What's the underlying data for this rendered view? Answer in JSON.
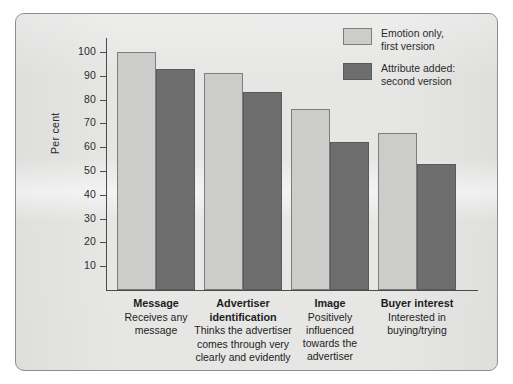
{
  "chart_data": {
    "type": "bar",
    "title": "",
    "xlabel": "",
    "ylabel": "Per cent",
    "ylim": [
      0,
      100
    ],
    "ytick_labels": [
      "100",
      "90",
      "80",
      "70",
      "60",
      "50",
      "40",
      "30",
      "20",
      "10"
    ],
    "ytick_values": [
      100,
      90,
      80,
      70,
      60,
      50,
      40,
      30,
      20,
      10
    ],
    "grid": false,
    "legend_position": "top-right",
    "categories": [
      "Message",
      "Advertiser identification",
      "Image",
      "Buyer interest"
    ],
    "category_titles": [
      "Message",
      "Advertiser",
      "Image",
      "Buyer interest"
    ],
    "category_descriptions": [
      "Receives any\nmessage",
      "identification\nThinks the advertiser\ncomes through very\nclearly and evidently",
      "Positively\ninfluenced\ntowards the\nadvertiser",
      "Interested in\nbuying/trying"
    ],
    "series": [
      {
        "name": "Emotion only,\nfirst version",
        "color": "#cccccb",
        "values": [
          100,
          91,
          76,
          66
        ]
      },
      {
        "name": "Attribute added:\nsecond version",
        "color": "#6e6e6e",
        "values": [
          93,
          83,
          62,
          53
        ]
      }
    ]
  },
  "colors": {
    "panel_background": "#e6e6e5",
    "panel_border": "#8e8e8e",
    "axis": "#4a4a4a",
    "text": "#2b2b2b",
    "series_light": "#cccccb",
    "series_dark": "#6e6e6e"
  }
}
